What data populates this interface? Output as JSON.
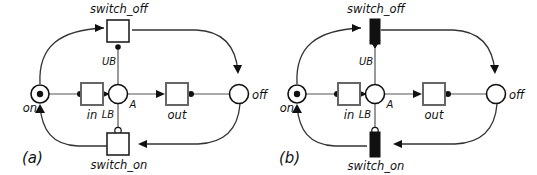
{
  "figure": {
    "background_color": "#ffffff",
    "stroke_color": "#333333",
    "fill_color": "#111111",
    "width": 537,
    "height": 175
  },
  "panels": [
    {
      "id": "a",
      "caption": "(a)",
      "places": [
        {
          "id": "on",
          "label": "on",
          "tokens": 1,
          "marking_dot": true
        },
        {
          "id": "A",
          "label": "A",
          "tokens": 0,
          "marking_dot": false
        },
        {
          "id": "off",
          "label": "off",
          "tokens": 0,
          "marking_dot": false
        }
      ],
      "transitions": [
        {
          "id": "switch_off",
          "label": "switch_off",
          "style": "hollow-square"
        },
        {
          "id": "in",
          "label": "in",
          "style": "hollow-square"
        },
        {
          "id": "out",
          "label": "out",
          "style": "hollow-square"
        },
        {
          "id": "switch_on",
          "label": "switch_on",
          "style": "hollow-square"
        }
      ],
      "arc_labels": [
        {
          "id": "UB",
          "label": "UB"
        },
        {
          "id": "LB",
          "label": "LB"
        }
      ],
      "arcs": [
        {
          "from": "on",
          "to": "switch_off",
          "type": "normal",
          "shape": "curve-top-left"
        },
        {
          "from": "switch_off",
          "to": "off",
          "type": "normal",
          "shape": "curve-top-right"
        },
        {
          "from": "switch_off",
          "to": "A",
          "type": "test",
          "shape": "vertical",
          "label": "UB"
        },
        {
          "from": "on",
          "to": "in",
          "type": "normal",
          "shape": "horizontal"
        },
        {
          "from": "in",
          "to": "A",
          "type": "normal",
          "shape": "horizontal"
        },
        {
          "from": "A",
          "to": "out",
          "type": "normal",
          "shape": "horizontal"
        },
        {
          "from": "out",
          "to": "off",
          "type": "normal",
          "shape": "horizontal"
        },
        {
          "from": "A",
          "to": "switch_on",
          "type": "inhibitor",
          "shape": "vertical",
          "label": "LB"
        },
        {
          "from": "off",
          "to": "switch_on",
          "type": "normal",
          "shape": "curve-bottom-right"
        },
        {
          "from": "switch_on",
          "to": "on",
          "type": "normal",
          "shape": "curve-bottom-left"
        }
      ]
    },
    {
      "id": "b",
      "caption": "(b)",
      "places": [
        {
          "id": "on",
          "label": "on",
          "tokens": 1,
          "marking_dot": true
        },
        {
          "id": "A",
          "label": "A",
          "tokens": 0,
          "marking_dot": false
        },
        {
          "id": "off",
          "label": "off",
          "tokens": 0,
          "marking_dot": false
        }
      ],
      "transitions": [
        {
          "id": "switch_off",
          "label": "switch_off",
          "style": "solid-bar"
        },
        {
          "id": "in",
          "label": "in",
          "style": "hollow-square"
        },
        {
          "id": "out",
          "label": "out",
          "style": "hollow-square"
        },
        {
          "id": "switch_on",
          "label": "switch_on",
          "style": "solid-bar"
        }
      ],
      "arc_labels": [
        {
          "id": "UB",
          "label": "UB"
        },
        {
          "id": "LB",
          "label": "LB"
        }
      ],
      "arcs": [
        {
          "from": "on",
          "to": "switch_off",
          "type": "normal",
          "shape": "curve-top-left"
        },
        {
          "from": "switch_off",
          "to": "off",
          "type": "normal",
          "shape": "curve-top-right"
        },
        {
          "from": "switch_off",
          "to": "A",
          "type": "test",
          "shape": "vertical",
          "label": "UB"
        },
        {
          "from": "on",
          "to": "in",
          "type": "normal",
          "shape": "horizontal"
        },
        {
          "from": "in",
          "to": "A",
          "type": "normal",
          "shape": "horizontal"
        },
        {
          "from": "A",
          "to": "out",
          "type": "normal",
          "shape": "horizontal"
        },
        {
          "from": "out",
          "to": "off",
          "type": "normal",
          "shape": "horizontal"
        },
        {
          "from": "A",
          "to": "switch_on",
          "type": "inhibitor",
          "shape": "vertical",
          "label": "LB"
        },
        {
          "from": "off",
          "to": "switch_on",
          "type": "normal",
          "shape": "curve-bottom-right"
        },
        {
          "from": "switch_on",
          "to": "on",
          "type": "normal",
          "shape": "curve-bottom-left"
        }
      ]
    }
  ]
}
